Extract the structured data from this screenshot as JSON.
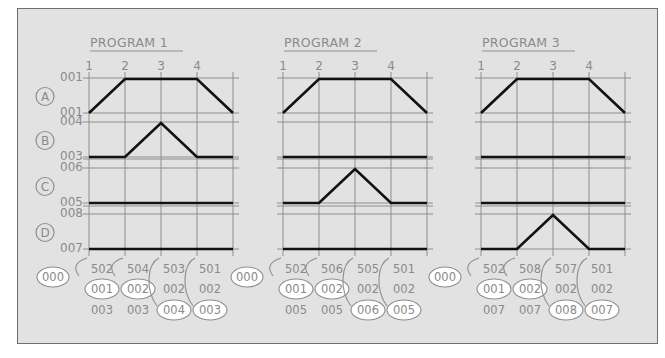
{
  "diagram": {
    "row_labels": [
      "A",
      "B",
      "C",
      "D"
    ],
    "column_numbers": [
      "1",
      "2",
      "3",
      "4"
    ],
    "row_values": {
      "A": {
        "top": "001",
        "bottom": "001"
      },
      "B": {
        "top": "004",
        "bottom": "003"
      },
      "C": {
        "top": "006",
        "bottom": "005"
      },
      "D": {
        "top": "008",
        "bottom": "007"
      }
    },
    "programs": [
      {
        "title": "PROGRAM 1",
        "waveforms": {
          "A": [
            0,
            1,
            1,
            1,
            0
          ],
          "B": [
            0,
            0,
            1,
            0,
            0
          ],
          "C": [
            0,
            0,
            0,
            0,
            0
          ],
          "D": [
            0,
            0,
            0,
            0,
            0
          ]
        },
        "root_bubble": "000",
        "steps": [
          {
            "code": "502",
            "mid": "001",
            "mid_circled": true,
            "bottom": "003",
            "bottom_circled": false
          },
          {
            "code": "504",
            "mid": "002",
            "mid_circled": true,
            "bottom": "003",
            "bottom_circled": false
          },
          {
            "code": "503",
            "mid": "002",
            "mid_circled": false,
            "bottom": "004",
            "bottom_circled": true
          },
          {
            "code": "501",
            "mid": "002",
            "mid_circled": false,
            "bottom": "003",
            "bottom_circled": true
          }
        ]
      },
      {
        "title": "PROGRAM 2",
        "waveforms": {
          "A": [
            0,
            1,
            1,
            1,
            0
          ],
          "B": [
            0,
            0,
            0,
            0,
            0
          ],
          "C": [
            0,
            0,
            1,
            0,
            0
          ],
          "D": [
            0,
            0,
            0,
            0,
            0
          ]
        },
        "root_bubble": "000",
        "steps": [
          {
            "code": "502",
            "mid": "001",
            "mid_circled": true,
            "bottom": "005",
            "bottom_circled": false
          },
          {
            "code": "506",
            "mid": "002",
            "mid_circled": true,
            "bottom": "005",
            "bottom_circled": false
          },
          {
            "code": "505",
            "mid": "002",
            "mid_circled": false,
            "bottom": "006",
            "bottom_circled": true
          },
          {
            "code": "501",
            "mid": "002",
            "mid_circled": false,
            "bottom": "005",
            "bottom_circled": true
          }
        ]
      },
      {
        "title": "PROGRAM 3",
        "waveforms": {
          "A": [
            0,
            1,
            1,
            1,
            0
          ],
          "B": [
            0,
            0,
            0,
            0,
            0
          ],
          "C": [
            0,
            0,
            0,
            0,
            0
          ],
          "D": [
            0,
            0,
            1,
            0,
            0
          ]
        },
        "root_bubble": "000",
        "steps": [
          {
            "code": "502",
            "mid": "001",
            "mid_circled": true,
            "bottom": "007",
            "bottom_circled": false
          },
          {
            "code": "508",
            "mid": "002",
            "mid_circled": true,
            "bottom": "007",
            "bottom_circled": false
          },
          {
            "code": "507",
            "mid": "002",
            "mid_circled": false,
            "bottom": "008",
            "bottom_circled": true
          },
          {
            "code": "501",
            "mid": "002",
            "mid_circled": false,
            "bottom": "007",
            "bottom_circled": true
          }
        ]
      }
    ],
    "colors": {
      "background": "#e2e2e2",
      "grid": "#8e8e8e",
      "text": "#8a8a8a",
      "waveform": "#111111",
      "bubble_fill": "#ffffff"
    }
  }
}
